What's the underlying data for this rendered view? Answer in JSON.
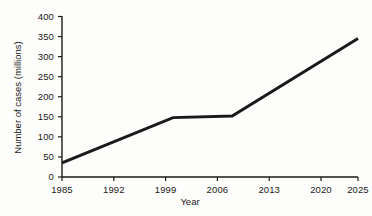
{
  "chart_data": {
    "type": "line",
    "title": "",
    "xlabel": "Year",
    "ylabel": "Number of cases (millions)",
    "xlim": [
      1985,
      2025
    ],
    "ylim": [
      0,
      400
    ],
    "grid": false,
    "legend": false,
    "xticks": [
      1985,
      1992,
      1999,
      2006,
      2013,
      2020,
      2025
    ],
    "xtick_labels": [
      "1985",
      "1992",
      "1999",
      "2006",
      "2013",
      "2020",
      "2025"
    ],
    "yticks": [
      0,
      50,
      100,
      150,
      200,
      250,
      300,
      350,
      400
    ],
    "ytick_labels": [
      "0",
      "50",
      "100",
      "150",
      "200",
      "250",
      "300",
      "350",
      "400"
    ],
    "series": [
      {
        "name": "Number of cases",
        "color": "#1a1a1a",
        "line_width": 3,
        "x": [
          1985,
          2000,
          2008,
          2025
        ],
        "values": [
          35,
          148,
          152,
          345
        ]
      }
    ]
  },
  "style": {
    "background": "#fdfdfb",
    "axis_color": "#1a1a1a",
    "text_color": "#1a1a1a",
    "line_color": "#1a1a1a"
  }
}
